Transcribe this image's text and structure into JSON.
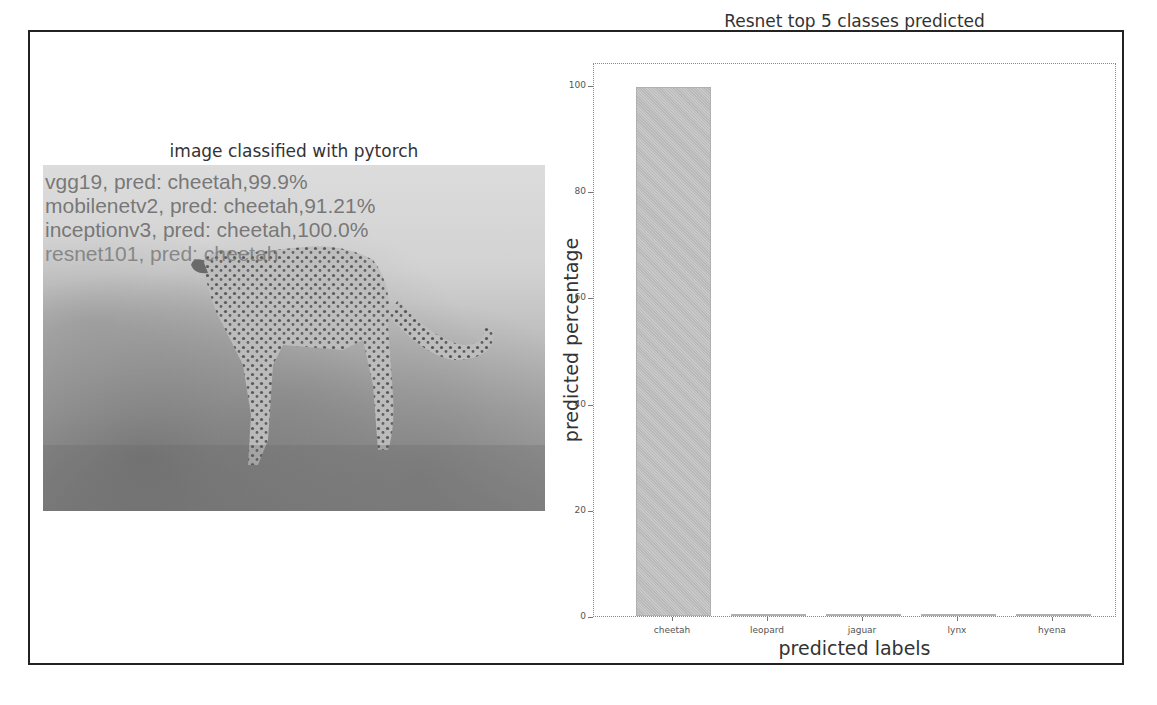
{
  "left_panel": {
    "title": "image classified with pytorch",
    "image_subject": "cheetah standing in grass",
    "overlay_lines": [
      "vgg19, pred: cheetah,99.9%",
      "mobilenetv2, pred: cheetah,91.21%",
      "inceptionv3, pred: cheetah,100.0%",
      "resnet101, pred: cheetah"
    ]
  },
  "chart_data": {
    "type": "bar",
    "title": "Resnet top 5 classes predicted",
    "xlabel": "predicted labels",
    "ylabel": "predicted percentage",
    "categories": [
      "cheetah",
      "leopard",
      "jaguar",
      "lynx",
      "hyena"
    ],
    "values": [
      99.6,
      0.3,
      0.02,
      0.01,
      0.01
    ],
    "ylim": [
      0,
      105
    ],
    "yticks": [
      0,
      20,
      40,
      60,
      80,
      100
    ],
    "grid": false,
    "legend": null,
    "color": "#c0c0c0"
  }
}
